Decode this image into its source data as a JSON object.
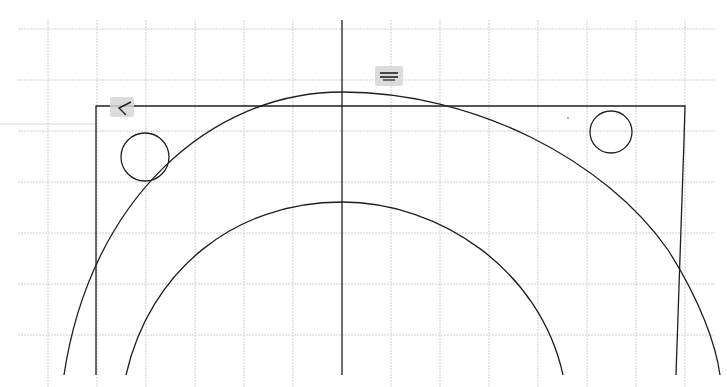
{
  "viewport": {
    "title": "CAD drawing viewport",
    "background_color": "#ffffff",
    "grid_color": "#cfcfcf",
    "line_color": "#1e1e1e"
  },
  "grid": {
    "vertical_x": [
      48,
      97,
      146,
      195,
      244,
      293,
      342,
      391,
      440,
      489,
      538,
      587,
      636,
      685
    ],
    "horizontal_y": [
      29,
      80,
      131,
      182,
      233,
      284,
      335
    ]
  },
  "entities": {
    "axis_vertical": {
      "x": 342
    },
    "frame": {
      "top_y": 106,
      "left_x": 96,
      "right_top_x": 685,
      "right_bottom_x": 676
    },
    "outer_arc": {
      "cx": 342,
      "top_y": 92
    },
    "inner_arc": {
      "cx": 342,
      "top_y": 202
    },
    "hole_left": {
      "cx": 145,
      "cy": 157,
      "r": 24
    },
    "hole_right": {
      "cx": 611,
      "cy": 132,
      "r": 21
    }
  },
  "markers": {
    "corner_marker": {
      "name": "angle-snap-marker",
      "glyph": "∠"
    },
    "tangent_marker": {
      "name": "parallel-constraint-marker",
      "glyph": "≡"
    }
  },
  "cursor": {
    "crosshair_y": 124
  }
}
